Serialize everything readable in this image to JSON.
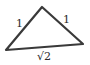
{
  "diagram": {
    "stroke_color": "#3a3a3a",
    "vertices": {
      "left": [
        6,
        50
      ],
      "top": [
        42,
        7
      ],
      "right": [
        83,
        44
      ]
    },
    "labels": {
      "left_side": "1",
      "right_side": "1",
      "base": "√2"
    }
  }
}
